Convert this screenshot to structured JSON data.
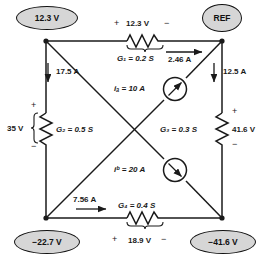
{
  "figure": {
    "type": "electrical-circuit-schematic"
  },
  "nodes": [
    {
      "id": "top-left",
      "label": "12.3 V",
      "x": 46,
      "y": 41
    },
    {
      "id": "top-right",
      "label": "REF",
      "x": 222,
      "y": 41
    },
    {
      "id": "bottom-left",
      "label": "−22.7 V",
      "x": 46,
      "y": 218
    },
    {
      "id": "bottom-right",
      "label": "−41.6 V",
      "x": 222,
      "y": 218
    }
  ],
  "elements": {
    "g1": {
      "name": "G₁",
      "value_label": "G₁ = 0.2 S",
      "voltage_label": "12.3 V",
      "plus": "+",
      "minus": "−"
    },
    "g2": {
      "name": "G₂",
      "value_label": "G₂ = 0.5 S",
      "voltage_label": "35 V",
      "plus": "+",
      "minus": "−"
    },
    "g3": {
      "name": "G₃",
      "value_label": "G₃ = 0.3 S",
      "voltage_label": "41.6 V",
      "plus": "+",
      "minus": "−"
    },
    "g4": {
      "name": "G₄",
      "value_label": "G₄ = 0.4 S",
      "voltage_label": "18.9 V",
      "plus": "+",
      "minus": "−"
    },
    "source_a": {
      "name": "iₐ",
      "label": "iₐ = 10 A",
      "direction": "up-right"
    },
    "source_b": {
      "name": "i_b",
      "label": "iᵇ = 20 A",
      "direction": "down-right"
    }
  },
  "currents": [
    {
      "id": "i-top-right",
      "label": "2.46 A",
      "direction": "right"
    },
    {
      "id": "i-left-branch",
      "label": "17.5 A",
      "direction": "down"
    },
    {
      "id": "i-right-branch",
      "label": "12.5 A",
      "direction": "down"
    },
    {
      "id": "i-bottom",
      "label": "7.56 A",
      "direction": "right"
    }
  ],
  "colors": {
    "wire": "#1a1a1a",
    "node_fill": "#d6d6d6",
    "node_stroke": "#121212",
    "text": "#1a1a1a",
    "background": "#ffffff"
  }
}
